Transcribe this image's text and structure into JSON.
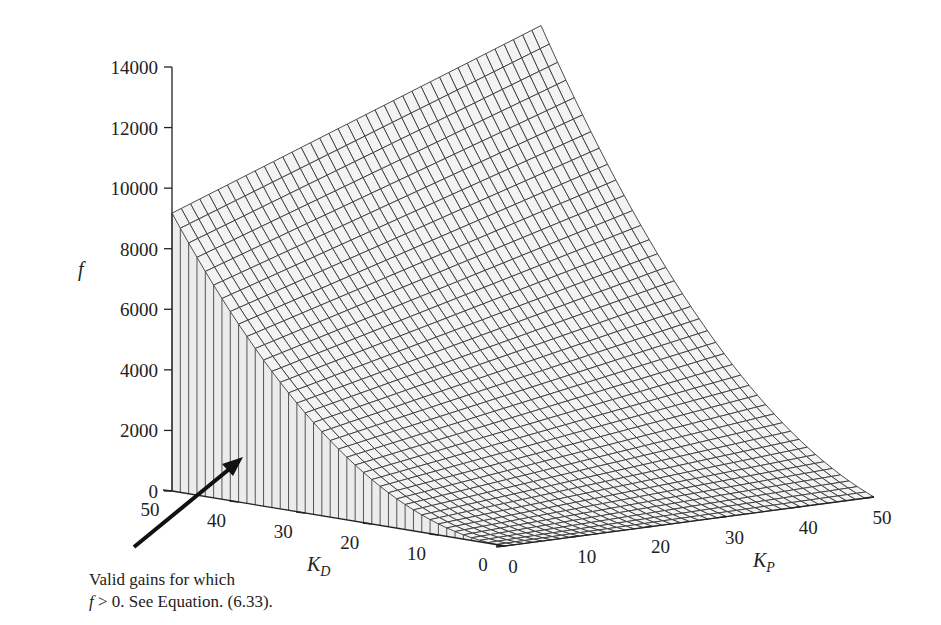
{
  "chart_data": {
    "type": "surface",
    "title": "",
    "xlabel": "K_P",
    "ylabel": "K_D",
    "zlabel": "f",
    "x_ticks": [
      0,
      10,
      20,
      30,
      40,
      50
    ],
    "y_ticks": [
      0,
      10,
      20,
      30,
      40,
      50
    ],
    "z_ticks": [
      0,
      2000,
      4000,
      6000,
      8000,
      10000,
      12000,
      14000
    ],
    "xlim": [
      0,
      50
    ],
    "ylim": [
      0,
      50
    ],
    "zlim": [
      0,
      14000
    ],
    "grid_resolution": 40,
    "surface_model": "f ≈ 3.67·K_D² + 1.83·K_P·K_D",
    "sample_points": [
      {
        "K_P": 0,
        "K_D": 0,
        "f": 0
      },
      {
        "K_P": 50,
        "K_D": 0,
        "f": 0
      },
      {
        "K_P": 0,
        "K_D": 50,
        "f": 9170
      },
      {
        "K_P": 50,
        "K_D": 50,
        "f": 13750
      },
      {
        "K_P": 50,
        "K_D": 25,
        "f": 4580
      },
      {
        "K_P": 0,
        "K_D": 25,
        "f": 2290
      }
    ],
    "annotation": {
      "line1": "Valid gains for which",
      "line2_prefix": "f",
      "line2_rest": " > 0.  See Equation. (6.33)."
    }
  },
  "labels": {
    "f": "f",
    "kp_main": "K",
    "kp_sub": "P",
    "kd_main": "K",
    "kd_sub": "D"
  }
}
